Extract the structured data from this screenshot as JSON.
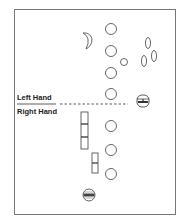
{
  "diagram": {
    "labels": {
      "left_hand": "Left Hand",
      "right_hand": "Right Hand"
    },
    "divider": {
      "style": "dashed",
      "y": 104
    },
    "shapes": {
      "moon_icon": {
        "cx": 88,
        "cy": 40
      },
      "small_circle": {
        "cx": 124,
        "cy": 62,
        "r": 3.5
      },
      "large_circles": [
        {
          "cx": 111,
          "cy": 29,
          "r": 5.5
        },
        {
          "cx": 111,
          "cy": 51,
          "r": 5.5
        },
        {
          "cx": 111,
          "cy": 73,
          "r": 5.5
        },
        {
          "cx": 111,
          "cy": 94,
          "r": 5.5
        },
        {
          "cx": 111,
          "cy": 126,
          "r": 5.5
        },
        {
          "cx": 111,
          "cy": 150,
          "r": 5.5
        },
        {
          "cx": 111,
          "cy": 174,
          "r": 5.5
        }
      ],
      "ovals": [
        {
          "cx": 148,
          "cy": 43,
          "rx": 2.5,
          "ry": 5.5
        },
        {
          "cx": 144,
          "cy": 61,
          "rx": 2.5,
          "ry": 5.5
        },
        {
          "cx": 154,
          "cy": 56,
          "rx": 2.5,
          "ry": 5.5
        }
      ],
      "lozenge_symbol": {
        "cx": 143,
        "cy": 101
      },
      "round_symbol": {
        "cx": 89,
        "cy": 194
      },
      "tall_bar": {
        "x": 81,
        "y": 112,
        "w": 7,
        "h": 37
      },
      "short_bar": {
        "x": 92,
        "y": 153,
        "w": 6,
        "h": 20
      }
    },
    "stroke_color": "#555555",
    "frame_color": "#777777"
  }
}
